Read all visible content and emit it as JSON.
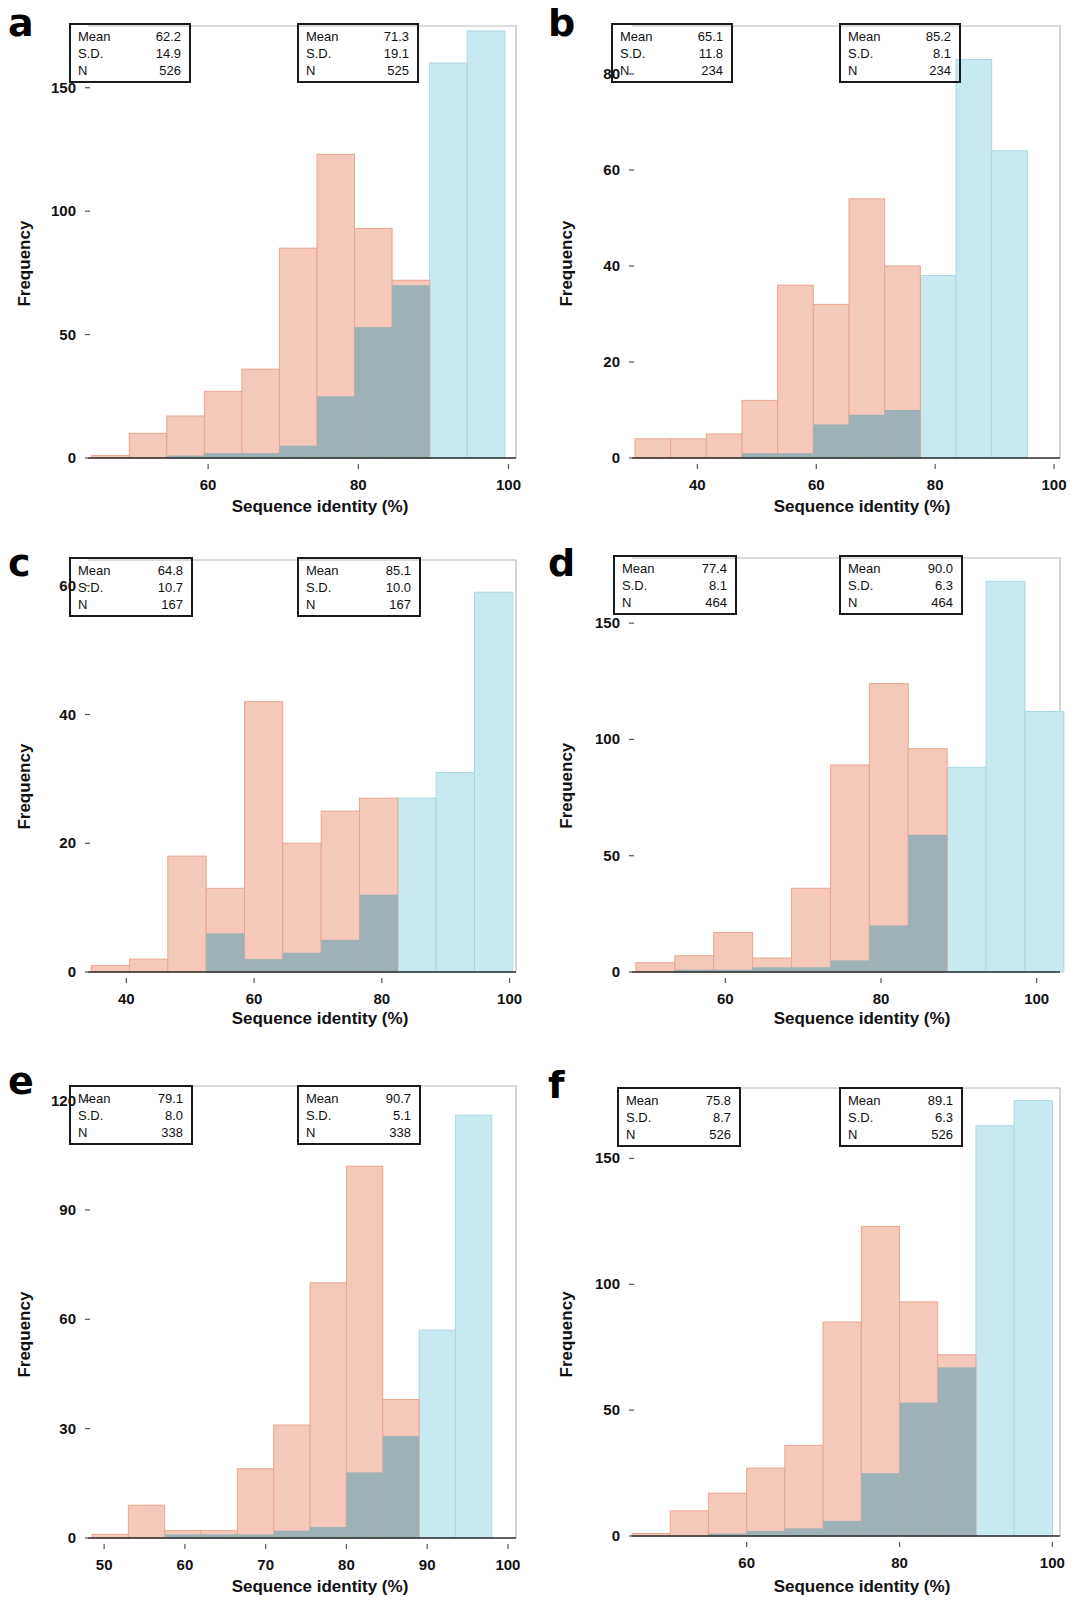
{
  "figure": {
    "background": "#ffffff",
    "series_colors": {
      "pink": "#f4c8bb",
      "pink_edge": "#e8a78f",
      "cyan": "#c9e9f0",
      "cyan_edge": "#a9d8e3",
      "overlap": "#9db1b6"
    },
    "axis_title_x": "Sequence identity (%)",
    "axis_title_y": "Frequency"
  },
  "panels": [
    {
      "letter": "a",
      "xlabel": "Sequence identity (%)",
      "ylabel": "Frequency",
      "xticks": [
        60,
        80,
        100
      ],
      "yticks": [
        0,
        50,
        100,
        150
      ],
      "xlim": [
        44,
        101
      ],
      "ylim": [
        0,
        175
      ],
      "stat_left": {
        "mean_label": "Mean",
        "mean": "62.2",
        "sd_label": "S.D.",
        "sd": "14.9",
        "n_label": "N",
        "n": "526"
      },
      "stat_right": {
        "mean_label": "Mean",
        "mean": "71.3",
        "sd_label": "S.D.",
        "sd": "19.1",
        "n_label": "N",
        "n": "525"
      },
      "chart_data": {
        "type": "bar",
        "title": "a",
        "xlabel": "Sequence identity (%)",
        "ylabel": "Frequency",
        "xlim": [
          44,
          101
        ],
        "ylim": [
          0,
          175
        ],
        "bin_edges": [
          44.5,
          49.5,
          54.5,
          59.5,
          64.5,
          69.5,
          74.5,
          79.5,
          84.5,
          89.5,
          94.5,
          99.5
        ],
        "series": [
          {
            "name": "pink",
            "values": [
              1,
              10,
              17,
              27,
              36,
              85,
              123,
              93,
              72,
              0,
              0
            ]
          },
          {
            "name": "cyan",
            "values": [
              0,
              0,
              1,
              2,
              2,
              5,
              25,
              53,
              70,
              160,
              173
            ]
          }
        ]
      }
    },
    {
      "letter": "b",
      "xlabel": "Sequence identity (%)",
      "ylabel": "Frequency",
      "xticks": [
        40,
        60,
        80,
        100
      ],
      "yticks": [
        0,
        20,
        40,
        60,
        80
      ],
      "xlim": [
        29,
        101
      ],
      "ylim": [
        0,
        90
      ],
      "stat_left": {
        "mean_label": "Mean",
        "mean": "65.1",
        "sd_label": "S.D.",
        "sd": "11.8",
        "n_label": "N",
        "n": "234"
      },
      "stat_right": {
        "mean_label": "Mean",
        "mean": "85.2",
        "sd_label": "S.D.",
        "sd": "8.1",
        "n_label": "N",
        "n": "234"
      },
      "chart_data": {
        "type": "bar",
        "title": "b",
        "xlabel": "Sequence identity (%)",
        "ylabel": "Frequency",
        "xlim": [
          29,
          101
        ],
        "ylim": [
          0,
          90
        ],
        "bin_edges": [
          29.5,
          35.5,
          41.5,
          47.5,
          53.5,
          59.5,
          65.5,
          71.5,
          77.5,
          83.5,
          89.5,
          95.5
        ],
        "series": [
          {
            "name": "pink",
            "values": [
              4,
              4,
              5,
              12,
              36,
              32,
              54,
              40,
              0,
              0,
              0
            ]
          },
          {
            "name": "cyan",
            "values": [
              0,
              0,
              0,
              1,
              1,
              7,
              9,
              10,
              38,
              83,
              64
            ]
          }
        ]
      }
    },
    {
      "letter": "c",
      "xlabel": "Sequence identity (%)",
      "ylabel": "Frequency",
      "xticks": [
        40,
        60,
        80,
        100
      ],
      "yticks": [
        0,
        20,
        40,
        60
      ],
      "xlim": [
        34,
        101
      ],
      "ylim": [
        0,
        64
      ],
      "stat_left": {
        "mean_label": "Mean",
        "mean": "64.8",
        "sd_label": "S.D.",
        "sd": "10.7",
        "n_label": "N",
        "n": "167"
      },
      "stat_right": {
        "mean_label": "Mean",
        "mean": "85.1",
        "sd_label": "S.D.",
        "sd": "10.0",
        "n_label": "N",
        "n": "167"
      },
      "chart_data": {
        "type": "bar",
        "title": "c",
        "xlabel": "Sequence identity (%)",
        "ylabel": "Frequency",
        "xlim": [
          34,
          101
        ],
        "ylim": [
          0,
          64
        ],
        "bin_edges": [
          34.5,
          40.5,
          46.5,
          52.5,
          58.5,
          64.5,
          70.5,
          76.5,
          82.5,
          88.5,
          94.5,
          100.5
        ],
        "series": [
          {
            "name": "pink",
            "values": [
              1,
              2,
              18,
              13,
              42,
              20,
              25,
              27,
              0,
              0,
              0
            ]
          },
          {
            "name": "cyan",
            "values": [
              0,
              0,
              0,
              6,
              2,
              3,
              5,
              12,
              27,
              31,
              59,
              24
            ]
          }
        ]
      }
    },
    {
      "letter": "d",
      "xlabel": "Sequence identity (%)",
      "ylabel": "Frequency",
      "xticks": [
        60,
        80,
        100
      ],
      "yticks": [
        0,
        50,
        100,
        150
      ],
      "xlim": [
        48,
        103
      ],
      "ylim": [
        0,
        178
      ],
      "stat_left": {
        "mean_label": "Mean",
        "mean": "77.4",
        "sd_label": "S.D.",
        "sd": "8.1",
        "n_label": "N",
        "n": "464"
      },
      "stat_right": {
        "mean_label": "Mean",
        "mean": "90.0",
        "sd_label": "S.D.",
        "sd": "6.3",
        "n_label": "N",
        "n": "464"
      },
      "chart_data": {
        "type": "bar",
        "title": "d",
        "xlabel": "Sequence identity (%)",
        "ylabel": "Frequency",
        "xlim": [
          48,
          103
        ],
        "ylim": [
          0,
          178
        ],
        "bin_edges": [
          48.5,
          53.5,
          58.5,
          63.5,
          68.5,
          73.5,
          78.5,
          83.5,
          88.5,
          93.5,
          98.5,
          103.5
        ],
        "series": [
          {
            "name": "pink",
            "values": [
              4,
              7,
              17,
              6,
              36,
              89,
              124,
              96,
              0,
              0,
              0
            ]
          },
          {
            "name": "cyan",
            "values": [
              0,
              1,
              1,
              2,
              2,
              5,
              20,
              59,
              88,
              168,
              112,
              14
            ]
          }
        ]
      }
    },
    {
      "letter": "e",
      "xlabel": "Sequence identity (%)",
      "ylabel": "Frequency",
      "xticks": [
        50,
        60,
        70,
        80,
        90,
        100
      ],
      "yticks": [
        0,
        30,
        60,
        90,
        120
      ],
      "xlim": [
        48,
        101
      ],
      "ylim": [
        0,
        124
      ],
      "stat_left": {
        "mean_label": "Mean",
        "mean": "79.1",
        "sd_label": "S.D.",
        "sd": "8.0",
        "n_label": "N",
        "n": "338"
      },
      "stat_right": {
        "mean_label": "Mean",
        "mean": "90.7",
        "sd_label": "S.D.",
        "sd": "5.1",
        "n_label": "N",
        "n": "338"
      },
      "chart_data": {
        "type": "bar",
        "title": "e",
        "xlabel": "Sequence identity (%)",
        "ylabel": "Frequency",
        "xlim": [
          48,
          101
        ],
        "ylim": [
          0,
          124
        ],
        "bin_edges": [
          48.5,
          53.0,
          57.5,
          62.0,
          66.5,
          71.0,
          75.5,
          80.0,
          84.5,
          89.0,
          93.5,
          98.0
        ],
        "series": [
          {
            "name": "pink",
            "values": [
              1,
              9,
              2,
              2,
              19,
              31,
              70,
              102,
              38,
              0,
              0
            ]
          },
          {
            "name": "cyan",
            "values": [
              0,
              0,
              1,
              1,
              1,
              2,
              3,
              18,
              28,
              57,
              116,
              52
            ]
          }
        ]
      }
    },
    {
      "letter": "f",
      "xlabel": "Sequence identity (%)",
      "ylabel": "Frequency",
      "xticks": [
        60,
        80,
        100
      ],
      "yticks": [
        0,
        50,
        100,
        150
      ],
      "xlim": [
        45,
        101
      ],
      "ylim": [
        0,
        178
      ],
      "stat_left": {
        "mean_label": "Mean",
        "mean": "75.8",
        "sd_label": "S.D.",
        "sd": "8.7",
        "n_label": "N",
        "n": "526"
      },
      "stat_right": {
        "mean_label": "Mean",
        "mean": "89.1",
        "sd_label": "S.D.",
        "sd": "6.3",
        "n_label": "N",
        "n": "526"
      },
      "chart_data": {
        "type": "bar",
        "title": "f",
        "xlabel": "Sequence identity (%)",
        "ylabel": "Frequency",
        "xlim": [
          45,
          101
        ],
        "ylim": [
          0,
          178
        ],
        "bin_edges": [
          45.0,
          50.0,
          55.0,
          60.0,
          65.0,
          70.0,
          75.0,
          80.0,
          85.0,
          90.0,
          95.0,
          100.0
        ],
        "series": [
          {
            "name": "pink",
            "values": [
              1,
              10,
              17,
              27,
              36,
              85,
              123,
              93,
              72,
              0,
              0
            ]
          },
          {
            "name": "cyan",
            "values": [
              0,
              0,
              1,
              2,
              3,
              6,
              25,
              53,
              67,
              163,
              173,
              63
            ]
          }
        ]
      }
    }
  ]
}
